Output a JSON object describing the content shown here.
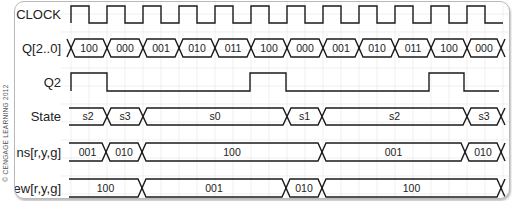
{
  "copyright": "© CENGAGE LEARNING 2012",
  "colors": {
    "line": "#1a1a1a",
    "grid": "#e6e6e6",
    "border": "#b9b9b9"
  },
  "timing": {
    "x_start": 70,
    "period": 36,
    "cycles": 12,
    "x_end": 500
  },
  "signals": [
    {
      "name": "CLOCK",
      "type": "clock",
      "label": "CLOCK",
      "y_hi": 5,
      "y_lo": 22
    },
    {
      "name": "Q",
      "type": "bus",
      "label": "Q[2..0]",
      "y_top": 38,
      "y_bot": 56,
      "segments": [
        {
          "start": 70,
          "end": 106,
          "value": "100"
        },
        {
          "start": 106,
          "end": 142,
          "value": "000"
        },
        {
          "start": 142,
          "end": 178,
          "value": "001"
        },
        {
          "start": 178,
          "end": 214,
          "value": "010"
        },
        {
          "start": 214,
          "end": 250,
          "value": "011"
        },
        {
          "start": 250,
          "end": 286,
          "value": "100"
        },
        {
          "start": 286,
          "end": 322,
          "value": "000"
        },
        {
          "start": 322,
          "end": 358,
          "value": "001"
        },
        {
          "start": 358,
          "end": 394,
          "value": "010"
        },
        {
          "start": 394,
          "end": 430,
          "value": "011"
        },
        {
          "start": 430,
          "end": 466,
          "value": "100"
        },
        {
          "start": 466,
          "end": 500,
          "value": "000"
        }
      ],
      "lead_x": true
    },
    {
      "name": "Q2",
      "type": "digital",
      "label": "Q2",
      "y_hi": 72,
      "y_lo": 90,
      "points": [
        {
          "x": 70,
          "level": 1
        },
        {
          "x": 106,
          "level": 0
        },
        {
          "x": 249,
          "level": 1
        },
        {
          "x": 285,
          "level": 0
        },
        {
          "x": 428,
          "level": 1
        },
        {
          "x": 463,
          "level": 0
        },
        {
          "x": 498,
          "level": 0
        }
      ]
    },
    {
      "name": "State",
      "type": "bus",
      "label": "State",
      "y_top": 107,
      "y_bot": 124,
      "segments": [
        {
          "start": 68,
          "end": 106,
          "value": "s2"
        },
        {
          "start": 106,
          "end": 142,
          "value": "s3"
        },
        {
          "start": 142,
          "end": 286,
          "value": "s0"
        },
        {
          "start": 286,
          "end": 321,
          "value": "s1"
        },
        {
          "start": 321,
          "end": 466,
          "value": "s2"
        },
        {
          "start": 466,
          "end": 500,
          "value": "s3"
        }
      ],
      "lead_x": false
    },
    {
      "name": "ns",
      "type": "bus",
      "label": "ns[r,y,g]",
      "y_top": 142,
      "y_bot": 160,
      "segments": [
        {
          "start": 68,
          "end": 105,
          "value": "001"
        },
        {
          "start": 105,
          "end": 141,
          "value": "010"
        },
        {
          "start": 141,
          "end": 321,
          "value": "100"
        },
        {
          "start": 321,
          "end": 464,
          "value": "001"
        },
        {
          "start": 464,
          "end": 500,
          "value": "010"
        }
      ],
      "lead_x": false
    },
    {
      "name": "ew",
      "type": "bus",
      "label": "ew[r,y,g]",
      "y_top": 178,
      "y_bot": 196,
      "segments": [
        {
          "start": 68,
          "end": 141,
          "value": "100"
        },
        {
          "start": 141,
          "end": 285,
          "value": "001"
        },
        {
          "start": 285,
          "end": 321,
          "value": "010"
        },
        {
          "start": 321,
          "end": 500,
          "value": "100"
        }
      ],
      "lead_x": false
    }
  ]
}
